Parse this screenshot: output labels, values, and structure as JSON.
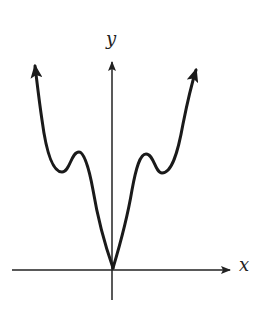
{
  "diagram": {
    "type": "function-graph",
    "axes": {
      "x_label": "x",
      "y_label": "y"
    },
    "curve": {
      "description": "Even function with V-shaped cusp at origin, two local maxima and two local minima, both ends rising to infinity",
      "cusp_at_origin": true,
      "symmetric_about_y_axis": true,
      "end_behavior": "both ends rise (arrows pointing up)"
    },
    "colors": {
      "stroke": "#1a1a1a",
      "axis": "#222222",
      "background": "#ffffff"
    }
  }
}
